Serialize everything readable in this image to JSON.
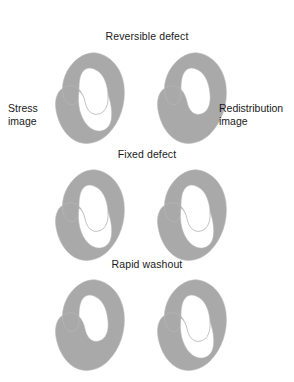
{
  "figure": {
    "caption_rows": [
      {
        "id": "reversible-defect",
        "title": "Reversible defect",
        "stress": {
          "label": "Stress image",
          "defect": true
        },
        "redistribution": {
          "label": "Redistribution image",
          "defect": false
        }
      },
      {
        "id": "fixed-defect",
        "title": "Fixed defect",
        "stress": {
          "defect": true
        },
        "redistribution": {
          "defect": true
        }
      },
      {
        "id": "rapid-washout",
        "title": "Rapid washout",
        "stress": {
          "defect": false
        },
        "redistribution": {
          "defect": true
        }
      }
    ],
    "side_labels": {
      "left_line1": "Stress",
      "left_line2": "image",
      "right_line1": "Redistribution",
      "right_line2": "image"
    },
    "colors": {
      "background": "#ffffff",
      "myocardium_fill": "#a9a9a9",
      "defect_fill": "#ffffff",
      "outline": "#b9b9b9",
      "text": "#1a1a1a"
    },
    "icon_names": {
      "myocardium": "myocardium-horseshoe-icon",
      "defect": "perfusion-defect-icon"
    }
  }
}
